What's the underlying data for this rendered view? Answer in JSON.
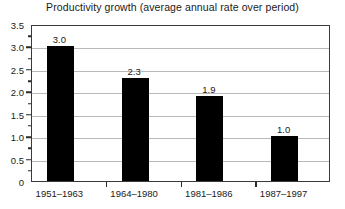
{
  "chart_data": {
    "type": "bar",
    "title": "Productivity growth (average annual rate over period)",
    "xlabel": "",
    "ylabel": "",
    "categories": [
      "1951–1963",
      "1964–1980",
      "1981–1986",
      "1987–1997"
    ],
    "values": [
      3.0,
      2.3,
      1.9,
      1.0
    ],
    "value_labels": [
      "3.0",
      "2.3",
      "1.9",
      "1.0"
    ],
    "ylim": [
      0,
      3.5
    ],
    "y_ticks": [
      0,
      0.5,
      1.0,
      1.5,
      2.0,
      2.5,
      3.0,
      3.5
    ],
    "y_tick_labels": [
      "0",
      "0.5",
      "1.0",
      "1.5",
      "2.0",
      "2.5",
      "3.0",
      "3.5"
    ],
    "y_minor_ticks": [
      0.25,
      0.75,
      1.25,
      1.75,
      2.25,
      2.75,
      3.25
    ],
    "grid": true,
    "grid_axis": "y",
    "legend": null,
    "bar_color": "#000000",
    "grid_color": "#b9b9b9",
    "axis_color": "#3a3a3a",
    "background_color": "#ffffff",
    "text_color": "#1a1a1a"
  }
}
